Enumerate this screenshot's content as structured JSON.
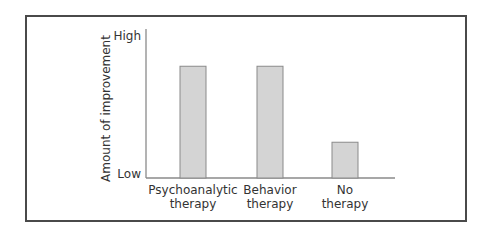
{
  "chart_data": {
    "type": "bar",
    "title": "",
    "xlabel": "",
    "ylabel": "Amount of improvement",
    "ytick_labels": [
      "Low",
      "High"
    ],
    "ylim": [
      0,
      1
    ],
    "categories": [
      [
        "Psychoanalytic",
        "therapy"
      ],
      [
        "Behavior",
        "therapy"
      ],
      [
        "No",
        "therapy"
      ]
    ],
    "category_names": [
      "Psychoanalytic therapy",
      "Behavior therapy",
      "No therapy"
    ],
    "values": [
      0.75,
      0.75,
      0.24
    ],
    "grid": false,
    "legend": "none",
    "colors": {
      "bar_fill": "#d4d4d4",
      "bar_stroke": "#8a8a8a",
      "axis": "#8a8a8a",
      "frame": "#4a4a4a",
      "text": "#333333"
    }
  }
}
